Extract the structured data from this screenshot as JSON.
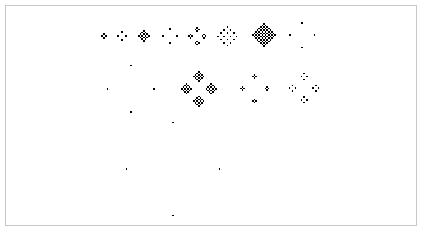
{
  "figure": {
    "title": "",
    "background_color": "#ffffff",
    "cell_color": "#000000",
    "border_color": "#c8c8c8",
    "width": 424,
    "height": 233,
    "frame": {
      "x": 5,
      "y": 5,
      "width": 412,
      "height": 221
    }
  },
  "chart_data": {
    "type": "heatmap",
    "title": "",
    "xlabel": "",
    "ylabel": "",
    "grid": false,
    "legend": null,
    "colormap": {
      "off": "#ffffff",
      "on": "#000000"
    },
    "automaton": {
      "rule_name": "fredkin-replicator",
      "neighborhood": "von-neumann",
      "rule": "cell on if number of on von-Neumann neighbours is odd",
      "seed": "single-cell"
    },
    "rows": [
      {
        "row_index": 0,
        "baseline_y": 36,
        "shapes": [
          {
            "index": 1,
            "generation": 1,
            "cell_px": 2.0,
            "radius": 1,
            "cx": 103,
            "cy": 35
          },
          {
            "index": 2,
            "generation": 2,
            "cell_px": 2.0,
            "radius": 2,
            "cx": 121,
            "cy": 35
          },
          {
            "index": 3,
            "generation": 3,
            "cell_px": 1.7,
            "radius": 3,
            "cx": 143,
            "cy": 35
          },
          {
            "index": 4,
            "generation": 4,
            "cell_px": 1.8,
            "radius": 4,
            "cx": 169,
            "cy": 35
          },
          {
            "index": 5,
            "generation": 5,
            "cell_px": 1.7,
            "radius": 5,
            "cx": 196,
            "cy": 35
          },
          {
            "index": 6,
            "generation": 6,
            "cell_px": 1.6,
            "radius": 6,
            "cx": 226,
            "cy": 35
          },
          {
            "index": 7,
            "generation": 7,
            "cell_px": 1.6,
            "radius": 7,
            "cx": 263,
            "cy": 34
          },
          {
            "index": 8,
            "generation": 8,
            "cell_px": 1.55,
            "radius": 8,
            "cx": 301,
            "cy": 34
          }
        ]
      },
      {
        "row_index": 1,
        "baseline_y": 88,
        "shapes": [
          {
            "index": 9,
            "generation": 16,
            "cell_px": 1.45,
            "radius": 16,
            "cx": 130,
            "cy": 88
          },
          {
            "index": 10,
            "generation": 11,
            "cell_px": 1.55,
            "radius": 11,
            "cx": 198,
            "cy": 88
          },
          {
            "index": 11,
            "generation": 9,
            "cell_px": 1.55,
            "radius": 9,
            "cx": 254,
            "cy": 88
          },
          {
            "index": 12,
            "generation": 10,
            "cell_px": 1.45,
            "radius": 10,
            "cx": 303,
            "cy": 87
          }
        ]
      },
      {
        "row_index": 2,
        "baseline_y": 168,
        "shapes": [
          {
            "index": 13,
            "generation": 32,
            "cell_px": 1.45,
            "radius": 32,
            "cx": 172,
            "cy": 168
          }
        ]
      }
    ],
    "shape_count": 13,
    "row_count": 3
  },
  "caption": {
    "text": "",
    "visible": false
  }
}
